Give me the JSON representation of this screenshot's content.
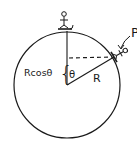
{
  "diagram": {
    "labels": {
      "point": "P",
      "radius": "R",
      "angle": "θ",
      "height": "Rcosθ",
      "brace": "{"
    },
    "colors": {
      "ink": "#1a1a1a",
      "background": "#ffffff"
    }
  }
}
